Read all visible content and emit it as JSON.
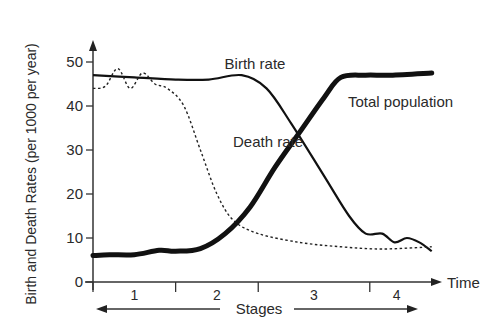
{
  "chart_data": {
    "type": "line",
    "title": "",
    "ylabel": "Birth and Death Rates (per 1000 per year)",
    "xlabel": "Time",
    "stage_label": "Stages",
    "ylim": [
      0,
      55
    ],
    "xlim": [
      0,
      4.2
    ],
    "yticks": [
      0,
      10,
      20,
      30,
      40,
      50
    ],
    "stages": [
      {
        "label": "1",
        "start": 0,
        "end": 1
      },
      {
        "label": "2",
        "start": 1,
        "end": 2
      },
      {
        "label": "3",
        "start": 2,
        "end": 3.35
      },
      {
        "label": "4",
        "start": 3.35,
        "end": 4.2
      }
    ],
    "grid": false,
    "legend": "inline-labels",
    "series": [
      {
        "name": "Birth rate",
        "style": "solid",
        "x": [
          0,
          0.5,
          1.0,
          1.4,
          1.8,
          2.1,
          2.4,
          2.8,
          3.1,
          3.3,
          3.5,
          3.65,
          3.8,
          3.95,
          4.1
        ],
        "y": [
          47,
          46.5,
          46,
          46,
          47,
          44,
          36,
          24,
          15,
          11,
          11,
          9,
          10,
          9,
          7
        ]
      },
      {
        "name": "Death rate",
        "style": "dotted",
        "x": [
          0,
          0.15,
          0.3,
          0.45,
          0.6,
          0.75,
          0.9,
          1.1,
          1.3,
          1.5,
          1.7,
          2.0,
          2.5,
          3.0,
          3.5,
          4.1
        ],
        "y": [
          44,
          44.5,
          48.5,
          44,
          47.5,
          45,
          44,
          40,
          30,
          20,
          14,
          11,
          9,
          8,
          7.5,
          8
        ]
      },
      {
        "name": "Total population",
        "style": "bold",
        "x": [
          0,
          0.2,
          0.5,
          0.8,
          1.0,
          1.3,
          1.6,
          1.9,
          2.2,
          2.5,
          2.8,
          3.0,
          3.3,
          3.6,
          4.1
        ],
        "y": [
          6,
          6.2,
          6.2,
          7.2,
          7,
          7.6,
          11,
          17,
          26,
          34,
          42,
          46.5,
          47,
          47,
          47.5
        ]
      }
    ],
    "annotations": [
      {
        "text": "Birth rate",
        "series": "Birth rate"
      },
      {
        "text": "Death rate",
        "series": "Death rate"
      },
      {
        "text": "Total population",
        "series": "Total population"
      }
    ]
  }
}
